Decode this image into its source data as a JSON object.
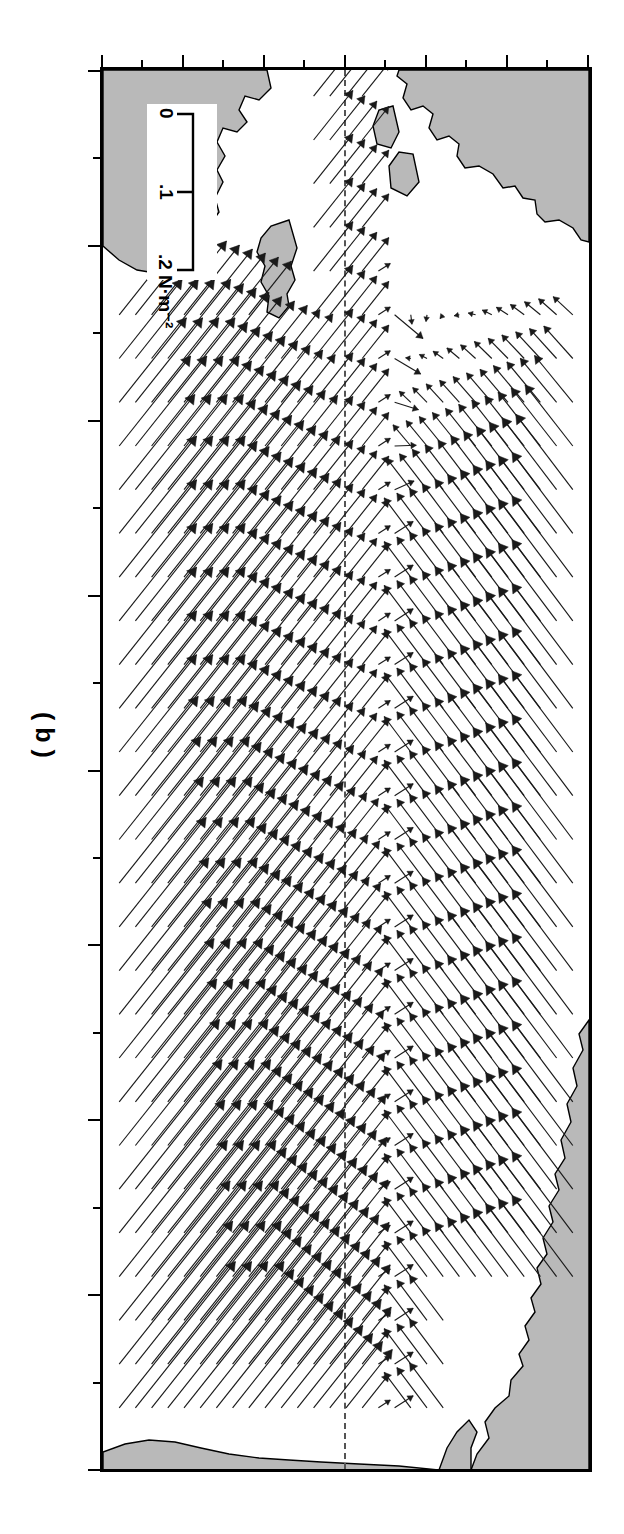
{
  "figure": {
    "panel_label": "( b )",
    "month_title": "AUGUST",
    "caption_note": ""
  },
  "chart_data": {
    "type": "scatter",
    "subtype": "vector-field-quiver",
    "title": "AUGUST",
    "xlabel": "",
    "ylabel": "",
    "grid": false,
    "legend_position": "bottom-right-inset",
    "projection": "cylindrical-equidistant",
    "orientation_note": "figure is printed rotated 90 degrees clockwise on the page",
    "xlim": [
      120,
      280
    ],
    "ylim": [
      -30,
      30
    ],
    "x_axis": {
      "name": "longitude",
      "major_ticks": [
        120,
        140,
        160,
        180,
        200,
        220,
        240,
        260,
        280
      ],
      "minor_ticks": [
        130,
        150,
        170,
        190,
        210,
        230,
        250,
        270
      ],
      "tick_labels": [
        "120°",
        "140°",
        "160°",
        "180°",
        "160°",
        "140°",
        "120°",
        "100°",
        "80° W"
      ]
    },
    "y_axis": {
      "name": "latitude",
      "major_ticks": [
        30,
        20,
        10,
        0,
        -10,
        -20,
        -30
      ],
      "minor_ticks": [
        25,
        15,
        5,
        -5,
        -15,
        -25
      ],
      "tick_labels": [
        "30°",
        "20°",
        "10°",
        "0°",
        "10°",
        "20°",
        "30°"
      ],
      "hemisphere_labels": [
        "N",
        "S"
      ]
    },
    "scale_legend": {
      "unit": "N·m-2",
      "unit_display": "N·m⁻²",
      "ticks": [
        "0",
        ".1",
        ".2"
      ],
      "values": [
        0,
        0.1,
        0.2
      ],
      "label": ".2 N·m⁻²"
    },
    "reference_lines": [
      {
        "name": "equator",
        "value": 0,
        "style": "long-dashed"
      }
    ],
    "series_name": "wind stress",
    "grid_spacing_deg": {
      "lon": 5,
      "lat": 2
    },
    "landmasses": [
      "Asia",
      "Australia",
      "New Guinea",
      "North America",
      "South America"
    ]
  }
}
